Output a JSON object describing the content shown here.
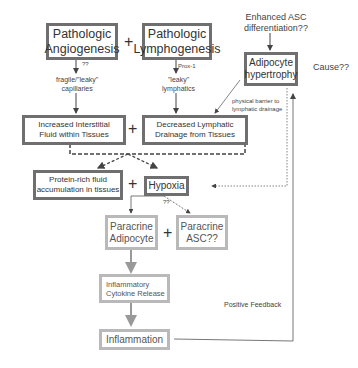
{
  "nodes": {
    "angiogenesis": "Pathologic\nAngiogenesis",
    "lymphogenesis": "Pathologic\nLymphogenesis",
    "adipocyte_hypertrophy": "Adipocyte\nhypertrophy",
    "interstitial_fluid": "Increased Interstitial\nFluid within Tissues",
    "decreased_drainage": "Decreased Lymphatic\nDrainage from Tissues",
    "protein_rich": "Protein-rich fluid\naccumulation in tissues",
    "hypoxia": "Hypoxia",
    "paracrine_adipocyte": "Paracrine\nAdipocyte",
    "paracrine_asc": "Paracrine\nASC??",
    "cytokine": "Inflammatory\nCytokine Release",
    "inflammation": "Inflammation"
  },
  "labels": {
    "enhanced_asc": "Enhanced ASC\ndifferentiation??",
    "cause": "Cause??",
    "angio_qq": "??",
    "fragile": "fragile/\"leaky\"\ncapillaries",
    "prox1": "Prox-1",
    "leaky_lymphatics": "\"leaky\"\nlymphatics",
    "physical_barrier": "physical barrier to\nlymphatic drainage",
    "hypoxia_qq": "??",
    "positive_feedback": "Positive Feedback"
  },
  "operators": {
    "plus": "+"
  },
  "colors": {
    "dark_border": "#6f6f6f",
    "light_border": "#b9b9b9",
    "arrow": "#555555",
    "light_arrow": "#999999"
  }
}
